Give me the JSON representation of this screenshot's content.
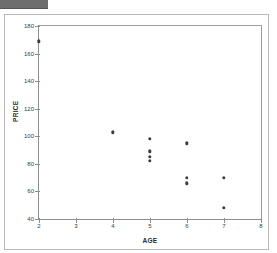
{
  "header": {
    "title": ""
  },
  "chart_data": {
    "type": "scatter",
    "title": "",
    "xlabel": "AGE",
    "ylabel": "PRICE",
    "xlim": [
      2,
      8
    ],
    "ylim": [
      40,
      180
    ],
    "xticks": [
      2,
      3,
      4,
      5,
      6,
      7,
      8
    ],
    "yticks": [
      40,
      60,
      80,
      100,
      120,
      140,
      160,
      180
    ],
    "xtick_labels": [
      "2",
      "3",
      "4",
      "5",
      "6",
      "7",
      "8"
    ],
    "ytick_labels": [
      "40",
      "60",
      "80",
      "100",
      "120",
      "140",
      "160",
      "180"
    ],
    "grid": false,
    "legend": false,
    "marker_color": "#3b3b3b",
    "points": [
      {
        "x": 2,
        "y": 169
      },
      {
        "x": 4,
        "y": 103
      },
      {
        "x": 5,
        "y": 98
      },
      {
        "x": 5,
        "y": 89
      },
      {
        "x": 5,
        "y": 85
      },
      {
        "x": 5,
        "y": 82
      },
      {
        "x": 6,
        "y": 95
      },
      {
        "x": 6,
        "y": 70
      },
      {
        "x": 6,
        "y": 66
      },
      {
        "x": 7,
        "y": 70
      },
      {
        "x": 7,
        "y": 48
      }
    ]
  }
}
